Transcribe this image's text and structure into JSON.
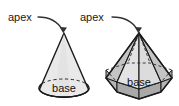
{
  "figure": {
    "type": "geometry-diagram",
    "background_color": "#ffffff",
    "shapes": [
      {
        "id": "cone",
        "name": "cone",
        "apex_label": "apex",
        "base_label": "base",
        "body_fill": "#e9e9e9",
        "base_fill": "#a9a9a9",
        "outline_color": "#1a1a1a"
      },
      {
        "id": "hexagonal-pyramid",
        "name": "hexagonal pyramid",
        "apex_label": "apex",
        "base_label": "base",
        "body_fill": "#e3e3e3",
        "face_fill_dark": "#bdbdbd",
        "base_fill": "#a9a9a9",
        "outline_color": "#1a1a1a"
      }
    ]
  },
  "labels": {
    "cone_apex": "apex",
    "cone_base": "base",
    "pyramid_apex": "apex",
    "pyramid_base": "base"
  }
}
